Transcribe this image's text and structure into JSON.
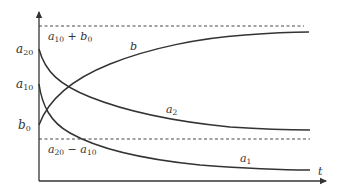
{
  "diagram": {
    "type": "concentration-time curves",
    "colors": {
      "stroke": "#333333",
      "background": "#ffffff"
    },
    "axes": {
      "x_label": "t",
      "y_labels": [
        {
          "id": "a20",
          "base": "a",
          "sub": "20"
        },
        {
          "id": "a10",
          "base": "a",
          "sub": "10"
        },
        {
          "id": "b0",
          "base": "b",
          "sub": "0"
        }
      ]
    },
    "asymptotes": [
      {
        "id": "upper",
        "label_parts": [
          "a",
          "10",
          " + ",
          "b",
          "0"
        ],
        "style": "dashed"
      },
      {
        "id": "lower",
        "label_parts": [
          "a",
          "20",
          " − ",
          "a",
          "10"
        ],
        "style": "dashed"
      }
    ],
    "curves": [
      {
        "id": "b",
        "base": "b",
        "sub": "",
        "trend": "rises from b0 toward a10 + b0"
      },
      {
        "id": "a2",
        "base": "a",
        "sub": "2",
        "trend": "decays from a20 toward a20 − a10"
      },
      {
        "id": "a1",
        "base": "a",
        "sub": "1",
        "trend": "decays from a10 toward 0"
      }
    ]
  }
}
